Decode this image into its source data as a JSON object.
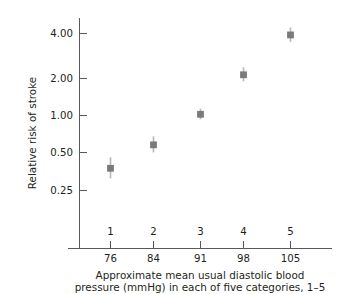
{
  "chart_data": {
    "type": "scatter",
    "title": "",
    "xlabel": "Approximate mean usual diastolic blood pressure (mmHg) in each of five categories, 1–5",
    "ylabel": "Relative risk of stroke",
    "y_scale": "log",
    "ylim": [
      0.2,
      4.8
    ],
    "y_ticks": [
      0.25,
      0.5,
      1.0,
      2.0,
      4.0
    ],
    "y_tick_labels": [
      "0.25",
      "0.50",
      "1.00",
      "2.00",
      "4.00"
    ],
    "grid": false,
    "legend": null,
    "categories": [
      "1",
      "2",
      "3",
      "4",
      "5"
    ],
    "x": [
      76,
      84,
      91,
      98,
      105
    ],
    "x_tick_labels": [
      "76",
      "84",
      "91",
      "98",
      "105"
    ],
    "values": [
      0.37,
      0.56,
      0.96,
      1.93,
      3.9
    ],
    "error_low": [
      0.31,
      0.49,
      0.88,
      1.72,
      3.45
    ],
    "error_high": [
      0.45,
      0.65,
      1.06,
      2.2,
      4.45
    ],
    "marker": "square",
    "marker_color": "#7b7b7e",
    "errorbar_color": "#b9b9bb",
    "axis_color": "#58595b",
    "text_color": "#231f20",
    "background": "#ffffff"
  },
  "axis": {
    "y_title": "Relative risk of stroke",
    "y_tick_labels": [
      "4.00",
      "2.00",
      "1.00",
      "0.50",
      "0.25"
    ],
    "category_labels": [
      "1",
      "2",
      "3",
      "4",
      "5"
    ],
    "x_tick_labels": [
      "76",
      "84",
      "91",
      "98",
      "105"
    ]
  },
  "caption": {
    "line1": "Approximate mean usual diastolic blood",
    "line2": "pressure (mmHg) in each of five categories, 1–5"
  }
}
